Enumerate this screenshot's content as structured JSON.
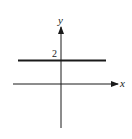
{
  "figure": {
    "axes": {
      "x_label": "x",
      "y_label": "y"
    },
    "tick_labels": {
      "y_intercept": "2"
    },
    "line": {
      "equation": "y = 2",
      "y_value": 2
    },
    "colors": {
      "ink": "#1a1a1a",
      "background": "#ffffff"
    }
  }
}
